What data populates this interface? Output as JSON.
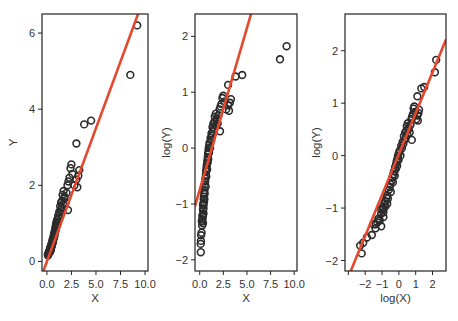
{
  "chart_data": [
    {
      "type": "scatter",
      "title": "",
      "xlabel": "X",
      "ylabel": "Y",
      "x_transform": "none",
      "y_transform": "none",
      "xlim": [
        -0.5,
        10.3
      ],
      "ylim": [
        -0.25,
        6.5
      ],
      "xticks": [
        0,
        2.5,
        5,
        7.5,
        10
      ],
      "xtick_labels": [
        "0.0",
        "2.5",
        "5.0",
        "7.5",
        "10.0"
      ],
      "yticks": [
        0,
        2,
        4,
        6
      ],
      "ytick_labels": [
        "0",
        "2",
        "4",
        "6"
      ],
      "grid": false,
      "fit_line": {
        "intercept": 0.0,
        "slope": 0.7
      },
      "box": {
        "x0": 42,
        "y0": 14,
        "x1": 148,
        "y1": 271
      }
    },
    {
      "type": "scatter",
      "title": "",
      "xlabel": "X",
      "ylabel": "log(Y)",
      "x_transform": "none",
      "y_transform": "log",
      "xlim": [
        -0.5,
        10.3
      ],
      "ylim": [
        -2.2,
        2.4
      ],
      "xticks": [
        0,
        2.5,
        5,
        7.5,
        10
      ],
      "xtick_labels": [
        "0.0",
        "2.5",
        "5.0",
        "7.5",
        "10.0"
      ],
      "yticks": [
        -2,
        -1,
        0,
        1,
        2
      ],
      "ytick_labels": [
        "−2",
        "−1",
        "0",
        "1",
        "2"
      ],
      "grid": false,
      "fit_line": {
        "intercept": -0.75,
        "slope": 0.58
      },
      "box": {
        "x0": 195,
        "y0": 14,
        "x1": 297,
        "y1": 271
      }
    },
    {
      "type": "scatter",
      "title": "",
      "xlabel": "log(X)",
      "ylabel": "log(Y)",
      "x_transform": "log",
      "y_transform": "log",
      "xlim": [
        -3.2,
        2.8
      ],
      "ylim": [
        -2.2,
        2.7
      ],
      "xticks": [
        -3,
        -2,
        -1,
        0,
        1,
        2
      ],
      "xtick_labels": [
        "",
        "−2",
        "−1",
        "0",
        "1",
        "2"
      ],
      "yticks": [
        -2,
        -1,
        0,
        1,
        2
      ],
      "ytick_labels": [
        "−2",
        "−1",
        "0",
        "1",
        "2"
      ],
      "grid": false,
      "fit_line": {
        "intercept": 0.03,
        "slope": 0.78
      },
      "box": {
        "x0": 345,
        "y0": 14,
        "x1": 446,
        "y1": 271
      }
    }
  ],
  "points": {
    "X": [
      0.1,
      0.11,
      0.12,
      0.15,
      0.2,
      0.22,
      0.25,
      0.28,
      0.3,
      0.32,
      0.35,
      0.38,
      0.4,
      0.42,
      0.45,
      0.48,
      0.5,
      0.52,
      0.55,
      0.58,
      0.6,
      0.62,
      0.65,
      0.68,
      0.7,
      0.72,
      0.75,
      0.78,
      0.8,
      0.83,
      0.85,
      0.88,
      0.9,
      0.93,
      0.95,
      0.98,
      1.0,
      1.05,
      1.1,
      1.15,
      1.2,
      1.25,
      1.3,
      1.35,
      1.4,
      1.45,
      1.5,
      1.55,
      1.6,
      1.65,
      1.7,
      1.75,
      1.8,
      1.9,
      2.0,
      2.1,
      2.15,
      2.2,
      2.3,
      2.4,
      2.5,
      2.6,
      2.8,
      3.0,
      3.1,
      3.2,
      3.3,
      3.0,
      3.8,
      4.5,
      8.5,
      9.2,
      0.25,
      0.3,
      0.35,
      0.4,
      0.45,
      0.35,
      0.4,
      0.5
    ],
    "Y": [
      0.18,
      0.155,
      0.19,
      0.21,
      0.22,
      0.27,
      0.25,
      0.28,
      0.3,
      0.29,
      0.33,
      0.37,
      0.36,
      0.4,
      0.42,
      0.45,
      0.47,
      0.44,
      0.52,
      0.55,
      0.58,
      0.5,
      0.62,
      0.66,
      0.6,
      0.7,
      0.74,
      0.68,
      0.8,
      0.77,
      0.85,
      0.9,
      0.82,
      0.95,
      1.0,
      0.92,
      1.05,
      1.1,
      1.0,
      1.2,
      1.15,
      1.3,
      1.25,
      1.45,
      1.35,
      1.55,
      1.4,
      1.6,
      1.75,
      1.5,
      1.85,
      1.65,
      1.7,
      1.55,
      1.8,
      2.0,
      1.35,
      2.1,
      2.2,
      2.45,
      2.55,
      2.3,
      2.0,
      2.15,
      1.95,
      2.25,
      2.4,
      3.1,
      3.6,
      3.7,
      4.9,
      6.2,
      0.27,
      0.3,
      0.26,
      0.34,
      0.38,
      0.36,
      0.31,
      0.4
    ]
  },
  "style": {
    "line_color": "#e5482d",
    "point_color": "#2b2b2b",
    "axis_color": "#222222",
    "text_color": "#333333"
  }
}
